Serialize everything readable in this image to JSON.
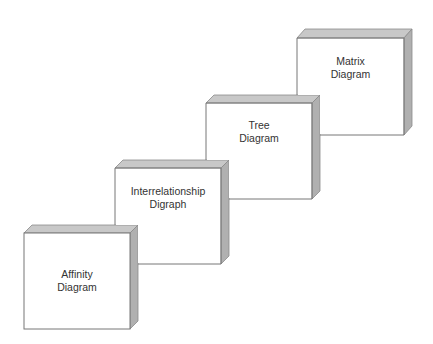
{
  "diagram": {
    "type": "staircase-of-3d-blocks",
    "colors": {
      "front": "#ffffff",
      "top": "#c8c8c8",
      "side": "#b0b0b0",
      "outline": "#777777",
      "text": "#333333"
    },
    "blocks": [
      {
        "id": "affinity",
        "line1": "Affinity",
        "line2": "Diagram",
        "x": 24,
        "y": 233,
        "w": 106,
        "h": 96
      },
      {
        "id": "interrelationship",
        "line1": "Interrelationship",
        "line2": "Digraph",
        "x": 115,
        "y": 168,
        "w": 106,
        "h": 96
      },
      {
        "id": "tree",
        "line1": "Tree",
        "line2": "Diagram",
        "x": 206,
        "y": 103,
        "w": 106,
        "h": 96
      },
      {
        "id": "matrix",
        "line1": "Matrix",
        "line2": "Diagram",
        "x": 297,
        "y": 38,
        "w": 107,
        "h": 97
      }
    ]
  }
}
